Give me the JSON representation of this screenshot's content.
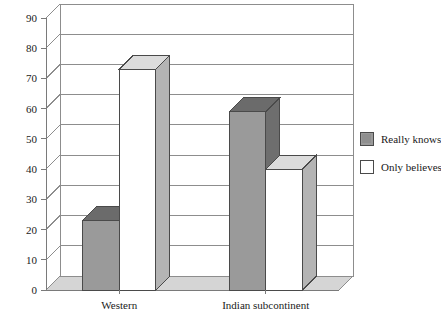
{
  "chart_data": {
    "type": "bar",
    "title": "",
    "subtitle": "",
    "xlabel": "",
    "ylabel": "",
    "categories": [
      "Western",
      "Indian subcontinent"
    ],
    "series": [
      {
        "name": "Really knows",
        "values": [
          23,
          59
        ],
        "color": "#9a9a9a"
      },
      {
        "name": "Only believes",
        "values": [
          73,
          40
        ],
        "color": "#ffffff"
      }
    ],
    "ylim": [
      0,
      90
    ],
    "yticks": [
      0,
      10,
      20,
      30,
      40,
      50,
      60,
      70,
      80,
      90
    ],
    "ytick_labels": [
      "0",
      "10",
      "20",
      "30",
      "40",
      "50",
      "60",
      "70",
      "80",
      "90"
    ],
    "grid": true,
    "grid_axis": "y",
    "legend_position": "right",
    "style": "3d-bar",
    "depth_px": 14
  },
  "legend": {
    "entries": [
      {
        "label": "Really knows",
        "swatch": "#9a9a9a"
      },
      {
        "label": "Only believes",
        "swatch": "#ffffff"
      }
    ]
  },
  "colors": {
    "bar_gray_front": "#9a9a9a",
    "bar_gray_top": "#6b6b6b",
    "bar_gray_side": "#6e6e6e",
    "bar_white_front": "#ffffff",
    "bar_white_top": "#dcdcdc",
    "bar_white_side": "#b4b4b4",
    "floor": "#d5d5d5",
    "axis_line": "#7a7a7a",
    "grid_line": "#8d8d8d",
    "text": "#1a1a1a",
    "background": "#ffffff"
  }
}
